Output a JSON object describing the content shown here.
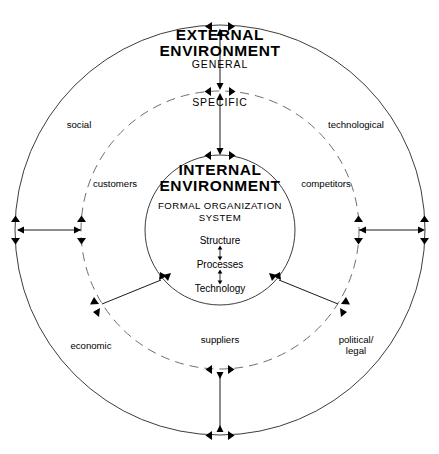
{
  "diagram": {
    "rings": {
      "outer": {
        "name": "external-environment-ring",
        "heading_line1": "EXTERNAL",
        "heading_line2": "ENVIRONMENT",
        "sublabel": "GENERAL",
        "style": "solid"
      },
      "middle": {
        "name": "specific-environment-ring",
        "sublabel": "SPECIFIC",
        "style": "dashed"
      },
      "inner": {
        "name": "internal-environment-ring",
        "heading_line1": "INTERNAL",
        "heading_line2": "ENVIRONMENT",
        "subtitle_line1": "FORMAL ORGANIZATION",
        "subtitle_line2": "SYSTEM",
        "style": "solid"
      }
    },
    "internal_components": [
      {
        "label": "Structure"
      },
      {
        "label": "Processes"
      },
      {
        "label": "Technology"
      }
    ],
    "general_environment_sectors": [
      {
        "label": "social"
      },
      {
        "label": "technological"
      },
      {
        "label": "economic"
      },
      {
        "label": "political/\nlegal"
      }
    ],
    "specific_environment_sectors": [
      {
        "label": "customers"
      },
      {
        "label": "competitors"
      },
      {
        "label": "suppliers"
      }
    ],
    "colors": {
      "ring_solid": "#3d3d3d",
      "ring_dashed": "#6e6e6e",
      "connector": "#1a1a1a",
      "text": "#000000",
      "background": "#ffffff"
    },
    "geometry": {
      "center_x": 220,
      "center_y": 230,
      "outer_radius": 205,
      "middle_radius": 139,
      "inner_radius": 75
    }
  }
}
